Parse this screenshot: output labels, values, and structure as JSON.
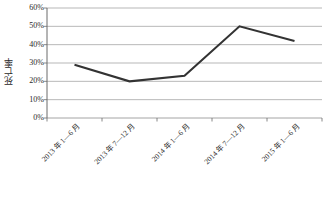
{
  "chart_data": {
    "type": "line",
    "title": "",
    "xlabel": "",
    "ylabel": "死亡率",
    "categories": [
      "2013 年 1—6 月",
      "2013 年 7—12 月",
      "2014 年 1—6 月",
      "2014 年 7—12 月",
      "2015 年 1—6 月"
    ],
    "values": [
      29,
      20,
      23,
      50,
      42
    ],
    "series": [
      {
        "name": "死亡率",
        "values": [
          29,
          20,
          23,
          50,
          42
        ]
      }
    ],
    "ylim": [
      0,
      60
    ],
    "ytick_values": [
      0,
      10,
      20,
      30,
      40,
      50,
      60
    ],
    "ytick_labels": [
      "0%",
      "10%",
      "20%",
      "30%",
      "40%",
      "50%",
      "60%"
    ],
    "value_format": "percent",
    "grid": true,
    "grid_axis": "y",
    "legend": false,
    "legend_position": "none",
    "line_color": "#333333",
    "grid_color": "#9a9a9a",
    "axis_color": "#6b6b6b",
    "background_color": "#ffffff"
  }
}
